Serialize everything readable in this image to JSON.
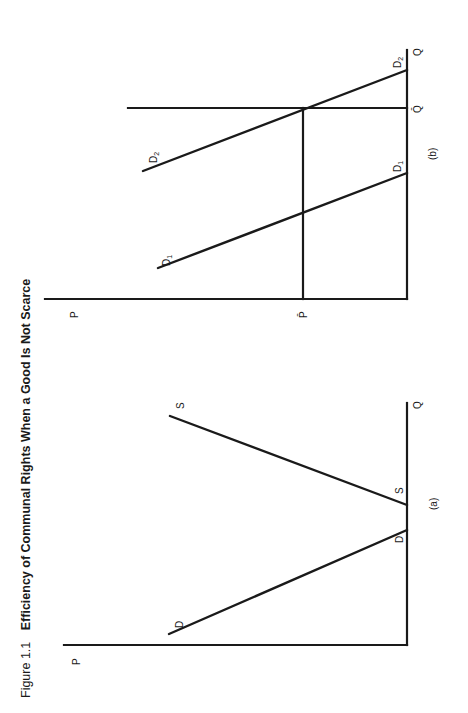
{
  "figure": {
    "number": "Figure 1.1",
    "title": "Efficiency of Communal Rights When a Good Is Not Scarce",
    "orientation": "rotated 90° counter-clockwise on page"
  },
  "panel_a": {
    "caption": "(a)",
    "axis_y_label": "P",
    "axis_x_label": "Q",
    "demand_label_start": "D",
    "demand_label_end": "D",
    "supply_label_start": "S",
    "supply_label_end": "S"
  },
  "panel_b": {
    "caption": "(b)",
    "axis_y_label": "P",
    "axis_x_label": "Q",
    "price_ceiling_label": "P̄",
    "quantity_limit_label": "Q̄",
    "d1_label_start": "D",
    "d1_sub_start": "1",
    "d1_label_end": "D",
    "d1_sub_end": "1",
    "d2_label_start": "D",
    "d2_sub_start": "2",
    "d2_label_end": "D",
    "d2_sub_end": "2"
  }
}
